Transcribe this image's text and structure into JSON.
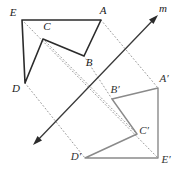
{
  "diagram": {
    "colors": {
      "preimage_stroke": "#2b2b2b",
      "image_stroke": "#8a8a8a",
      "mirror_line": "#3a3a3a",
      "connector_dotted": "#9a9a9a",
      "background": "#ffffff",
      "label_text": "#1a1a1a",
      "label_text_image": "#333333"
    },
    "mirror_line": {
      "name": "m",
      "label": "m",
      "label_x": 163,
      "label_y": 9,
      "arrow_start_x": 33,
      "arrow_start_y": 145,
      "arrow_end_x": 158,
      "arrow_end_y": 15,
      "double_headed": true
    },
    "preimage": {
      "name": "ABCDE",
      "closed": true,
      "vertices": [
        {
          "name": "A",
          "label": "A",
          "x": 101,
          "y": 20,
          "label_x": 103,
          "label_y": 11
        },
        {
          "name": "B",
          "label": "B",
          "x": 84,
          "y": 56,
          "label_x": 89,
          "label_y": 63
        },
        {
          "name": "C",
          "label": "C",
          "x": 43,
          "y": 39,
          "label_x": 47,
          "label_y": 27
        },
        {
          "name": "D",
          "label": "D",
          "x": 25,
          "y": 83,
          "label_x": 16,
          "label_y": 89
        },
        {
          "name": "E",
          "label": "E",
          "x": 22,
          "y": 20,
          "label_x": 13,
          "label_y": 13
        }
      ]
    },
    "image": {
      "name": "A'B'C'D'E'",
      "closed": true,
      "vertices": [
        {
          "name": "A-prime",
          "label": "A′",
          "x": 158,
          "y": 88,
          "label_x": 164,
          "label_y": 79
        },
        {
          "name": "B-prime",
          "label": "B′",
          "x": 112,
          "y": 99,
          "label_x": 115,
          "label_y": 90
        },
        {
          "name": "C-prime",
          "label": "C′",
          "x": 137,
          "y": 134,
          "label_x": 144,
          "label_y": 131
        },
        {
          "name": "D-prime",
          "label": "D′",
          "x": 85,
          "y": 158,
          "label_x": 76,
          "label_y": 157
        },
        {
          "name": "E-prime",
          "label": "E′",
          "x": 158,
          "y": 158,
          "label_x": 166,
          "label_y": 160
        }
      ]
    },
    "connectors": [
      {
        "name": "connector-A-to-A-prime",
        "from": "A",
        "to": "A'",
        "x1": 101,
        "y1": 20,
        "x2": 158,
        "y2": 88
      },
      {
        "name": "connector-B-to-B-prime",
        "from": "B",
        "to": "B'",
        "x1": 84,
        "y1": 56,
        "x2": 112,
        "y2": 99
      },
      {
        "name": "connector-C-to-C-prime",
        "from": "C",
        "to": "C'",
        "x1": 43,
        "y1": 39,
        "x2": 137,
        "y2": 134
      },
      {
        "name": "connector-D-to-D-prime",
        "from": "D",
        "to": "D'",
        "x1": 25,
        "y1": 83,
        "x2": 85,
        "y2": 158
      },
      {
        "name": "connector-E-to-E-prime",
        "from": "E",
        "to": "E'",
        "x1": 22,
        "y1": 20,
        "x2": 158,
        "y2": 158
      }
    ]
  }
}
